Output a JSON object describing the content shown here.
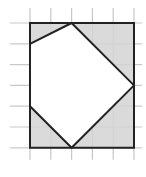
{
  "diagram": {
    "type": "grid-geometry",
    "grid": {
      "columns": 5,
      "rows": 6,
      "cell_size_px": 20.8,
      "origin_px": [
        30,
        23
      ],
      "line_color": "#c8c8c8",
      "extend_left_px": 20,
      "extend_right_px": 8,
      "extend_top_px": 15,
      "extend_bottom_px": 12
    },
    "rectangle": {
      "corners_grid": [
        [
          0,
          0
        ],
        [
          5,
          0
        ],
        [
          5,
          6
        ],
        [
          0,
          6
        ]
      ],
      "fill": "#d4d4d4",
      "stroke": "#222222"
    },
    "inscribed_polygon": {
      "vertices_grid": [
        [
          2,
          0
        ],
        [
          5,
          3
        ],
        [
          2,
          6
        ],
        [
          0,
          4
        ],
        [
          0,
          1
        ]
      ],
      "fill": "#ffffff",
      "stroke": "#222222"
    },
    "shaded_regions": [
      {
        "name": "top-left-triangle",
        "vertices_grid": [
          [
            0,
            0
          ],
          [
            2,
            0
          ],
          [
            0,
            1
          ]
        ]
      },
      {
        "name": "top-right-triangle",
        "vertices_grid": [
          [
            2,
            0
          ],
          [
            5,
            0
          ],
          [
            5,
            3
          ]
        ]
      },
      {
        "name": "bottom-right-triangle",
        "vertices_grid": [
          [
            5,
            3
          ],
          [
            5,
            6
          ],
          [
            2,
            6
          ]
        ]
      },
      {
        "name": "bottom-left-triangle",
        "vertices_grid": [
          [
            0,
            4
          ],
          [
            2,
            6
          ],
          [
            0,
            6
          ]
        ]
      }
    ]
  }
}
